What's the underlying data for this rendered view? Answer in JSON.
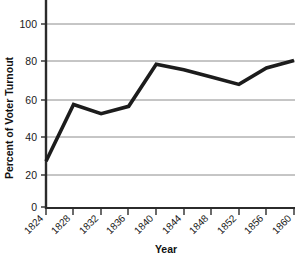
{
  "chart_data": {
    "type": "line",
    "title": "",
    "xlabel": "Year",
    "ylabel": "Percent of Voter Turnout",
    "categories": [
      "1824",
      "1828",
      "1832",
      "1836",
      "1840",
      "1844",
      "1848",
      "1852",
      "1856",
      "1860"
    ],
    "x": [
      1824,
      1828,
      1832,
      1836,
      1840,
      1844,
      1848,
      1852,
      1856,
      1860
    ],
    "values": [
      25,
      56,
      51,
      55,
      78,
      75,
      71,
      67,
      76,
      80
    ],
    "series": [
      {
        "name": "Percent of Voter Turnout",
        "values": [
          25,
          56,
          51,
          55,
          78,
          75,
          71,
          67,
          76,
          80
        ],
        "color": "#1c1c1c"
      }
    ],
    "ylim": [
      0,
      100
    ],
    "yticks": [
      0,
      20,
      40,
      60,
      80,
      100
    ],
    "ytick_labels": [
      "0",
      "20",
      "40",
      "60",
      "80",
      "100"
    ],
    "xtick_labels": [
      "1824",
      "1828",
      "1832",
      "1836",
      "1840",
      "1844",
      "1848",
      "1852",
      "1856",
      "1860"
    ],
    "grid": "horizontal",
    "grid_color": "#8c8c8c",
    "axis_color": "#2b2b2b",
    "legend": "none",
    "legend_position": "none",
    "background": "#ffffff"
  },
  "labels": {
    "y_axis_title": "Percent of Voter Turnout",
    "x_axis_title": "Year",
    "y_0": "0",
    "y_20": "20",
    "y_40": "40",
    "y_60": "60",
    "y_80": "80",
    "y_100": "100",
    "x_1824": "1824",
    "x_1828": "1828",
    "x_1832": "1832",
    "x_1836": "1836",
    "x_1840": "1840",
    "x_1844": "1844",
    "x_1848": "1848",
    "x_1852": "1852",
    "x_1856": "1856",
    "x_1860": "1860"
  }
}
